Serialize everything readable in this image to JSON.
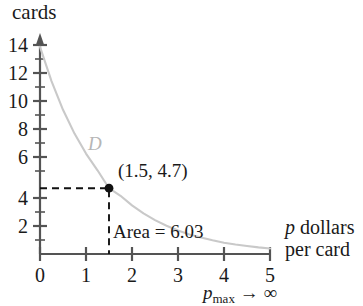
{
  "chart_data": {
    "type": "line",
    "title": "",
    "ylabel": "cards",
    "xlabel": "p dollars per card",
    "xlabel_line1": "p dollars",
    "xlabel_line2": "per card",
    "xaxis_annotation": "pmax → ∞",
    "xaxis_annotation_base": "p",
    "xaxis_annotation_sub": "max",
    "xaxis_annotation_tail": "→ ∞",
    "curve_label": "D",
    "xlim": [
      0,
      5
    ],
    "ylim": [
      0,
      15
    ],
    "xticks": [
      "0",
      "1",
      "2",
      "3",
      "4",
      "5"
    ],
    "xtick_values": [
      0,
      1,
      2,
      3,
      4,
      5
    ],
    "yticks": [
      "2",
      "4",
      "6",
      "8",
      "10",
      "12",
      "14"
    ],
    "ytick_values": [
      2,
      4,
      6,
      8,
      10,
      12,
      14
    ],
    "yminor_values": [
      1,
      3,
      5,
      7,
      9,
      11,
      13
    ],
    "grid": false,
    "legend": "none",
    "curve_color": "#c9c9c9",
    "axis_color": "#545454",
    "marker_color": "#111111",
    "series": [
      {
        "name": "D",
        "formula": "D = 14 e^(-0.727 p)",
        "x": [
          0,
          0.25,
          0.5,
          0.75,
          1,
          1.25,
          1.5,
          1.75,
          2,
          2.25,
          2.5,
          2.75,
          3,
          3.25,
          3.5,
          3.75,
          4,
          4.25,
          4.5,
          4.75,
          5
        ],
        "y": [
          14.8,
          12.35,
          10.3,
          8.6,
          7.17,
          5.98,
          4.7,
          4.16,
          3.47,
          2.9,
          2.42,
          2.02,
          1.68,
          1.4,
          1.17,
          0.98,
          0.81,
          0.68,
          0.57,
          0.47,
          0.39
        ]
      }
    ],
    "annotations": [
      {
        "name": "point-label",
        "text": "(1.5, 4.7)",
        "x": 1.5,
        "y": 4.7
      },
      {
        "name": "area-label",
        "text": "Area = 6.03"
      },
      {
        "name": "curve-name",
        "text": "D"
      }
    ],
    "marked_point": {
      "label": "(1.5, 4.7)",
      "x": 1.5,
      "y": 4.7
    },
    "area_value": "6.03",
    "area_label": "Area = 6.03"
  }
}
